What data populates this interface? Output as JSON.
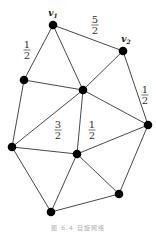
{
  "caption": "图 6.4  自旋网络",
  "nodes": [
    {
      "id": "v1",
      "label": "v",
      "sub": "1",
      "x": 53,
      "y": 25
    },
    {
      "id": "v2",
      "label": "v",
      "sub": "2",
      "x": 123,
      "y": 51
    },
    {
      "id": "left_upper",
      "x": 24,
      "y": 80
    },
    {
      "id": "center",
      "x": 83,
      "y": 90
    },
    {
      "id": "far_left",
      "x": 12,
      "y": 147
    },
    {
      "id": "right",
      "x": 148,
      "y": 125
    },
    {
      "id": "mid_lower",
      "x": 77,
      "y": 154
    },
    {
      "id": "lower_right",
      "x": 119,
      "y": 194
    },
    {
      "id": "bottom",
      "x": 51,
      "y": 212
    }
  ],
  "edges": [
    [
      "v1",
      "v2"
    ],
    [
      "v1",
      "left_upper"
    ],
    [
      "v1",
      "center"
    ],
    [
      "v2",
      "center"
    ],
    [
      "v2",
      "right"
    ],
    [
      "left_upper",
      "center"
    ],
    [
      "left_upper",
      "far_left"
    ],
    [
      "center",
      "far_left"
    ],
    [
      "center",
      "mid_lower"
    ],
    [
      "center",
      "right"
    ],
    [
      "far_left",
      "mid_lower"
    ],
    [
      "far_left",
      "bottom"
    ],
    [
      "mid_lower",
      "bottom"
    ],
    [
      "mid_lower",
      "lower_right"
    ],
    [
      "mid_lower",
      "right"
    ],
    [
      "right",
      "lower_right"
    ],
    [
      "bottom",
      "lower_right"
    ]
  ],
  "edge_labels": [
    {
      "num": "1",
      "den": "2",
      "x": 27,
      "y": 50,
      "edge": "v1-left_upper"
    },
    {
      "num": "5",
      "den": "2",
      "x": 95,
      "y": 25,
      "edge": "v1-v2"
    },
    {
      "num": "1",
      "den": "2",
      "x": 145,
      "y": 95,
      "edge": "v2-right"
    },
    {
      "num": "3",
      "den": "2",
      "x": 58,
      "y": 130,
      "edge": "far_left-center"
    },
    {
      "num": "1",
      "den": "2",
      "x": 92,
      "y": 130,
      "edge": "center-mid_lower"
    }
  ]
}
